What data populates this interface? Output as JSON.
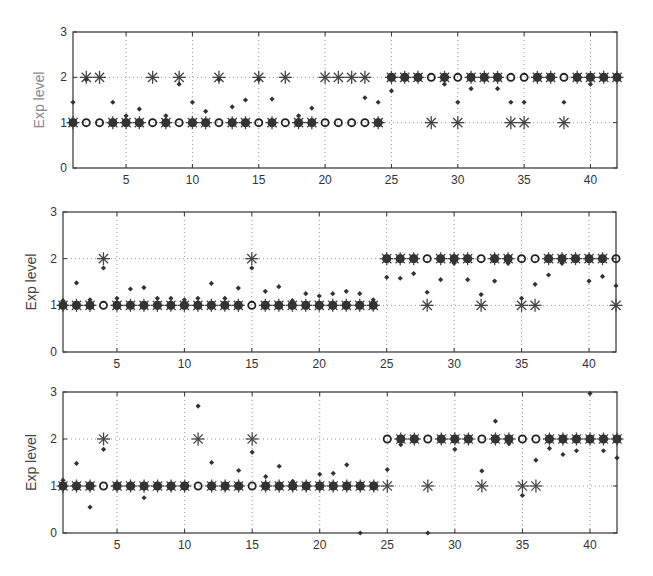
{
  "chart_data": [
    {
      "type": "scatter",
      "title": "",
      "xlabel": "",
      "ylabel": "Exp level",
      "xlim": [
        1,
        42
      ],
      "ylim": [
        0,
        3
      ],
      "xticks": [
        5,
        10,
        15,
        20,
        25,
        30,
        35,
        40
      ],
      "yticks": [
        0,
        1,
        2,
        3
      ],
      "grid": true,
      "label_color": "#888888",
      "series": [
        {
          "name": "true level (circle)",
          "marker": "circle",
          "x": [
            1,
            2,
            3,
            4,
            5,
            6,
            7,
            8,
            9,
            10,
            11,
            12,
            13,
            14,
            15,
            16,
            17,
            18,
            19,
            20,
            21,
            22,
            23,
            24,
            25,
            26,
            27,
            28,
            29,
            30,
            31,
            32,
            33,
            34,
            35,
            36,
            37,
            38,
            39,
            40,
            41,
            42
          ],
          "y": [
            1,
            1,
            1,
            1,
            1,
            1,
            1,
            1,
            1,
            1,
            1,
            1,
            1,
            1,
            1,
            1,
            1,
            1,
            1,
            1,
            1,
            1,
            1,
            1,
            2,
            2,
            2,
            2,
            2,
            2,
            2,
            2,
            2,
            2,
            2,
            2,
            2,
            2,
            2,
            2,
            2,
            2
          ]
        },
        {
          "name": "predicted level (asterisk)",
          "marker": "asterisk",
          "x": [
            1,
            2,
            3,
            4,
            5,
            6,
            7,
            8,
            9,
            10,
            11,
            12,
            13,
            14,
            15,
            16,
            17,
            18,
            19,
            20,
            21,
            22,
            23,
            24,
            25,
            26,
            27,
            28,
            29,
            30,
            31,
            32,
            33,
            34,
            35,
            36,
            37,
            38,
            39,
            40,
            41,
            42
          ],
          "y": [
            1,
            2,
            2,
            1,
            1,
            1,
            2,
            1,
            2,
            1,
            1,
            2,
            1,
            1,
            2,
            1,
            2,
            1,
            1,
            2,
            2,
            2,
            2,
            1,
            2,
            2,
            2,
            1,
            2,
            1,
            2,
            2,
            2,
            1,
            1,
            2,
            2,
            1,
            2,
            2,
            2,
            2
          ]
        },
        {
          "name": "estimated value (dot)",
          "marker": "dot",
          "x": [
            1,
            2,
            4,
            5,
            6,
            8,
            9,
            10,
            11,
            12,
            13,
            14,
            15,
            16,
            18,
            19,
            23,
            24,
            25,
            29,
            30,
            31,
            33,
            34,
            35,
            38,
            40
          ],
          "y": [
            1.45,
            1.95,
            1.45,
            1.15,
            1.3,
            1.15,
            1.85,
            1.45,
            1.25,
            1.95,
            1.35,
            1.5,
            1.95,
            1.52,
            1.15,
            1.32,
            1.55,
            1.45,
            1.7,
            1.85,
            1.45,
            1.75,
            1.75,
            1.45,
            1.45,
            1.45,
            1.85
          ]
        }
      ]
    },
    {
      "type": "scatter",
      "title": "",
      "xlabel": "",
      "ylabel": "Exp level",
      "xlim": [
        1,
        42
      ],
      "ylim": [
        0,
        3
      ],
      "xticks": [
        5,
        10,
        15,
        20,
        25,
        30,
        35,
        40
      ],
      "yticks": [
        0,
        1,
        2,
        3
      ],
      "grid": true,
      "label_color": "#444444",
      "series": [
        {
          "name": "true level (circle)",
          "marker": "circle",
          "x": [
            1,
            2,
            3,
            4,
            5,
            6,
            7,
            8,
            9,
            10,
            11,
            12,
            13,
            14,
            15,
            16,
            17,
            18,
            19,
            20,
            21,
            22,
            23,
            24,
            25,
            26,
            27,
            28,
            29,
            30,
            31,
            32,
            33,
            34,
            35,
            36,
            37,
            38,
            39,
            40,
            41,
            42
          ],
          "y": [
            1,
            1,
            1,
            1,
            1,
            1,
            1,
            1,
            1,
            1,
            1,
            1,
            1,
            1,
            1,
            1,
            1,
            1,
            1,
            1,
            1,
            1,
            1,
            1,
            2,
            2,
            2,
            2,
            2,
            2,
            2,
            2,
            2,
            2,
            2,
            2,
            2,
            2,
            2,
            2,
            2,
            2
          ]
        },
        {
          "name": "predicted level (asterisk)",
          "marker": "asterisk",
          "x": [
            1,
            2,
            3,
            4,
            5,
            6,
            7,
            8,
            9,
            10,
            11,
            12,
            13,
            14,
            15,
            16,
            17,
            18,
            19,
            20,
            21,
            22,
            23,
            24,
            25,
            26,
            27,
            28,
            29,
            30,
            31,
            32,
            33,
            34,
            35,
            36,
            37,
            38,
            39,
            40,
            41,
            42
          ],
          "y": [
            1,
            1,
            1,
            2,
            1,
            1,
            1,
            1,
            1,
            1,
            1,
            1,
            1,
            1,
            2,
            1,
            1,
            1,
            1,
            1,
            1,
            1,
            1,
            1,
            2,
            2,
            2,
            1,
            2,
            2,
            2,
            1,
            2,
            2,
            1,
            1,
            2,
            2,
            2,
            2,
            2,
            1
          ]
        },
        {
          "name": "estimated value (dot)",
          "marker": "dot",
          "x": [
            1,
            2,
            3,
            4,
            5,
            6,
            7,
            8,
            9,
            10,
            11,
            12,
            13,
            14,
            15,
            16,
            17,
            18,
            19,
            20,
            21,
            22,
            23,
            24,
            25,
            26,
            27,
            28,
            29,
            30,
            31,
            32,
            33,
            34,
            35,
            36,
            37,
            38,
            40,
            41,
            42
          ],
          "y": [
            1.1,
            1.48,
            1.12,
            1.8,
            1.15,
            1.35,
            1.38,
            1.15,
            1.15,
            1.12,
            1.15,
            1.47,
            1.15,
            1.37,
            1.8,
            1.3,
            1.4,
            1.1,
            1.25,
            1.2,
            1.25,
            1.3,
            1.25,
            1.12,
            1.6,
            1.58,
            1.68,
            1.28,
            1.55,
            1.9,
            1.55,
            1.23,
            1.52,
            1.9,
            1.15,
            1.45,
            1.65,
            1.9,
            1.52,
            1.62,
            1.42
          ]
        }
      ]
    },
    {
      "type": "scatter",
      "title": "",
      "xlabel": "",
      "ylabel": "Exp level",
      "xlim": [
        1,
        42
      ],
      "ylim": [
        0,
        3
      ],
      "xticks": [
        5,
        10,
        15,
        20,
        25,
        30,
        35,
        40
      ],
      "yticks": [
        0,
        1,
        2,
        3
      ],
      "grid": true,
      "label_color": "#444444",
      "series": [
        {
          "name": "true level (circle)",
          "marker": "circle",
          "x": [
            1,
            2,
            3,
            4,
            5,
            6,
            7,
            8,
            9,
            10,
            11,
            12,
            13,
            14,
            15,
            16,
            17,
            18,
            19,
            20,
            21,
            22,
            23,
            24,
            25,
            26,
            27,
            28,
            29,
            30,
            31,
            32,
            33,
            34,
            35,
            36,
            37,
            38,
            39,
            40,
            41,
            42
          ],
          "y": [
            1,
            1,
            1,
            1,
            1,
            1,
            1,
            1,
            1,
            1,
            1,
            1,
            1,
            1,
            1,
            1,
            1,
            1,
            1,
            1,
            1,
            1,
            1,
            1,
            2,
            2,
            2,
            2,
            2,
            2,
            2,
            2,
            2,
            2,
            2,
            2,
            2,
            2,
            2,
            2,
            2,
            2
          ]
        },
        {
          "name": "predicted level (asterisk)",
          "marker": "asterisk",
          "x": [
            1,
            2,
            3,
            4,
            5,
            6,
            7,
            8,
            9,
            10,
            11,
            12,
            13,
            14,
            15,
            16,
            17,
            18,
            19,
            20,
            21,
            22,
            23,
            24,
            25,
            26,
            27,
            28,
            29,
            30,
            31,
            32,
            33,
            34,
            35,
            36,
            37,
            38,
            39,
            40,
            41,
            42
          ],
          "y": [
            1,
            1,
            1,
            2,
            1,
            1,
            1,
            1,
            1,
            1,
            2,
            1,
            1,
            1,
            2,
            1,
            1,
            1,
            1,
            1,
            1,
            1,
            1,
            1,
            1,
            2,
            2,
            1,
            2,
            2,
            2,
            1,
            2,
            2,
            1,
            1,
            2,
            2,
            2,
            2,
            2,
            2
          ]
        },
        {
          "name": "estimated value (dot)",
          "marker": "dot",
          "x": [
            1,
            2,
            3,
            4,
            7,
            9,
            11,
            12,
            13,
            14,
            15,
            16,
            17,
            18,
            20,
            21,
            22,
            23,
            25,
            26,
            28,
            30,
            32,
            33,
            34,
            35,
            36,
            37,
            38,
            39,
            40,
            41,
            42
          ],
          "y": [
            1.12,
            1.48,
            0.55,
            1.78,
            0.75,
            0.95,
            2.7,
            1.5,
            0.95,
            1.33,
            1.72,
            1.2,
            1.42,
            1.1,
            1.25,
            1.27,
            1.45,
            0.0,
            1.35,
            1.88,
            0.0,
            1.78,
            1.32,
            2.38,
            1.9,
            0.8,
            1.55,
            1.8,
            1.67,
            1.75,
            2.97,
            1.75,
            1.6
          ]
        }
      ]
    }
  ]
}
